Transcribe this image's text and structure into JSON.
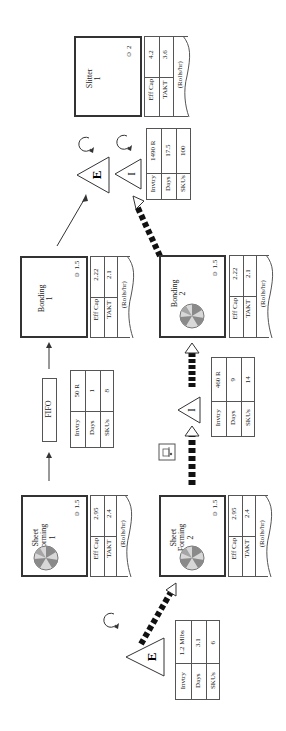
{
  "processes": {
    "slitter_1": {
      "name": "Slitter",
      "number": "1",
      "operators": "2",
      "eff_cap_label": "Eff Cap",
      "eff_cap": "4.2",
      "takt_label": "TAKT",
      "takt": "3.6",
      "units": "(Rolls/hr)"
    },
    "bonding_1": {
      "name": "Bonding",
      "number": "1",
      "operators": "1.5",
      "eff_cap_label": "Eff Cap",
      "eff_cap": "2.22",
      "takt_label": "TAKT",
      "takt": "2.1",
      "units": "(Rolls/hr)"
    },
    "bonding_2": {
      "name": "Bonding",
      "number": "2",
      "operators": "1.5",
      "eff_cap_label": "Eff Cap",
      "eff_cap": "2.22",
      "takt_label": "TAKT",
      "takt": "2.1",
      "units": "(Rolls/hr)"
    },
    "sheet_forming_1": {
      "name": "Sheet",
      "name2": "Forming",
      "number": "1",
      "operators": "1.5",
      "eff_cap_label": "Eff Cap",
      "eff_cap": "2.95",
      "takt_label": "TAKT",
      "takt": "2.4",
      "units": "(Rolls/hr)"
    },
    "sheet_forming_2": {
      "name": "Sheet",
      "name2": "Forming",
      "number": "2",
      "operators": "1.5",
      "eff_cap_label": "Eff Cap",
      "eff_cap": "2.95",
      "takt_label": "TAKT",
      "takt": "2.4",
      "units": "(Rolls/hr)"
    }
  },
  "inventories": {
    "pre_slitter": {
      "invtry_label": "Invtry",
      "invtry": "1490 R",
      "days_label": "Days",
      "days": "17.5",
      "skus_label": "SKUs",
      "skus": "100"
    },
    "fifo": {
      "invtry_label": "Invtry",
      "invtry": "50 R",
      "days_label": "Days",
      "days": "1",
      "skus_label": "SKUs",
      "skus": "8"
    },
    "pre_bonding_2": {
      "invtry_label": "Invtry",
      "invtry": "460 R",
      "days_label": "Days",
      "days": "9",
      "skus_label": "SKUs",
      "skus": "14"
    },
    "raw": {
      "invtry_label": "Invtry",
      "invtry": "1.2 Mlbs",
      "days_label": "Days",
      "days": "3.1",
      "skus_label": "SKUs",
      "skus": "6"
    }
  },
  "fifo_label": "FIFO",
  "operator_symbol": "☺",
  "icons": {
    "operator": "operator-icon",
    "changeover_dial": "changeover-dial-icon",
    "inventory_triangle": "inventory-triangle-icon",
    "cycle_arrow": "cycle-arrow-icon",
    "push_arrow": "push-arrow-icon",
    "forklift": "forklift-icon"
  },
  "colors": {
    "line": "#333333",
    "table_line": "#555555",
    "dial_light": "#d8d8d8",
    "dial_dark": "#8a8a8a"
  }
}
